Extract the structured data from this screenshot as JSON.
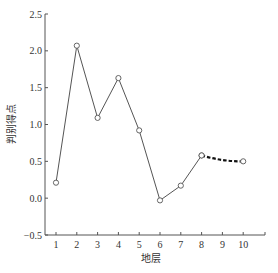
{
  "chart_data": {
    "type": "line",
    "title": "",
    "xlabel": "地层",
    "ylabel": "判别得点",
    "x": [
      1,
      2,
      3,
      4,
      5,
      6,
      7,
      8,
      9,
      10
    ],
    "x_ticks": [
      "1",
      "2",
      "3",
      "4",
      "5",
      "6",
      "7",
      "8",
      "9",
      "10"
    ],
    "y_ticks": [
      "2.5",
      "2.0",
      "1.5",
      "1.0",
      "0.5",
      "0.0",
      "−0.5"
    ],
    "y_tick_values": [
      2.5,
      2.0,
      1.5,
      1.0,
      0.5,
      0.0,
      -0.5
    ],
    "ylim": [
      -0.5,
      2.5
    ],
    "xlim": [
      0.5,
      11
    ],
    "grid": false,
    "legend": null,
    "series": [
      {
        "name": "observed",
        "style": "solid",
        "marker": "open-circle",
        "x": [
          1,
          2,
          3,
          4,
          5,
          6,
          7,
          8
        ],
        "values": [
          0.21,
          2.07,
          1.09,
          1.63,
          0.92,
          -0.03,
          0.17,
          0.58
        ]
      },
      {
        "name": "predicted",
        "style": "dashed-bold",
        "marker": "open-circle-at-end",
        "x": [
          8,
          9,
          10
        ],
        "values": [
          0.58,
          0.51,
          0.5
        ]
      }
    ],
    "colors": {
      "line": "#555555",
      "axis": "#555555",
      "dashed": "#111111"
    }
  }
}
